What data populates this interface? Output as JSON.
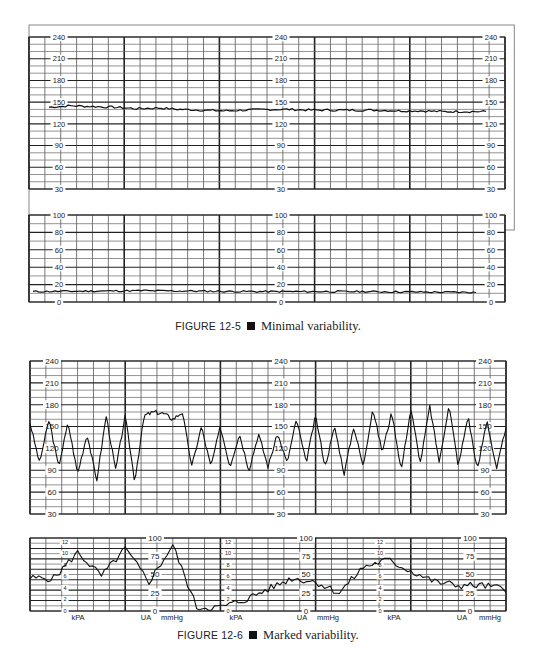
{
  "figures": [
    {
      "id": "fig-12-5",
      "caption": {
        "label": "FIGURE 12-5",
        "text": "Minimal variability."
      },
      "fhr_ticks": [
        "240",
        "210",
        "180",
        "150",
        "120",
        "90",
        "60",
        "30"
      ],
      "ua_ticks": [
        "100",
        "80",
        "60",
        "40",
        "20",
        "0"
      ]
    },
    {
      "id": "fig-12-6",
      "caption": {
        "label": "FIGURE 12-6",
        "text": "Marked variability."
      },
      "fhr_ticks": [
        "240",
        "210",
        "180",
        "150",
        "120",
        "90",
        "60",
        "30"
      ],
      "ua_mmhg_ticks": [
        "100",
        "75",
        "50",
        "25",
        "0"
      ],
      "ua_kpa_ticks": [
        "12",
        "10",
        "8",
        "6",
        "4",
        "2",
        "0"
      ],
      "ua_labels": {
        "kpa": "kPA",
        "ua": "UA",
        "mmhg": "mmHg"
      }
    }
  ],
  "chart_data": [
    {
      "type": "line",
      "title": "FIGURE 12-5 Minimal variability.",
      "panels": [
        {
          "name": "Fetal heart rate",
          "ylabel": "bpm",
          "ylim": [
            30,
            240
          ],
          "yticks": [
            30,
            60,
            90,
            120,
            150,
            180,
            210,
            240
          ],
          "x": [
            0,
            0.05,
            0.1,
            0.15,
            0.2,
            0.25,
            0.3,
            0.35,
            0.4,
            0.45,
            0.5,
            0.55,
            0.6,
            0.65,
            0.7,
            0.75,
            0.8,
            0.85,
            0.9,
            0.95,
            1.0
          ],
          "values": [
            143,
            145,
            144,
            143,
            141,
            142,
            140,
            139,
            138,
            139,
            140,
            140,
            139,
            139,
            139,
            139,
            138,
            138,
            137,
            137,
            137
          ],
          "note": "Baseline ~140 bpm with amplitude range <5 bpm"
        },
        {
          "name": "Uterine activity",
          "ylabel": "mmHg",
          "ylim": [
            0,
            100
          ],
          "yticks": [
            0,
            20,
            40,
            60,
            80,
            100
          ],
          "x": [
            0,
            0.25,
            0.5,
            0.75,
            1.0
          ],
          "values": [
            12,
            13,
            12,
            12,
            11
          ]
        }
      ],
      "grid": true
    },
    {
      "type": "line",
      "title": "FIGURE 12-6 Marked variability.",
      "panels": [
        {
          "name": "Fetal heart rate",
          "ylabel": "bpm",
          "ylim": [
            30,
            240
          ],
          "yticks": [
            30,
            60,
            90,
            120,
            150,
            180,
            210,
            240
          ],
          "x": [
            0,
            0.02,
            0.04,
            0.06,
            0.08,
            0.1,
            0.12,
            0.14,
            0.16,
            0.18,
            0.2,
            0.22,
            0.24,
            0.26,
            0.28,
            0.3,
            0.32,
            0.34,
            0.36,
            0.38,
            0.4,
            0.42,
            0.44,
            0.46,
            0.48,
            0.5,
            0.52,
            0.54,
            0.56,
            0.58,
            0.6,
            0.62,
            0.64,
            0.66,
            0.68,
            0.7,
            0.72,
            0.74,
            0.76,
            0.78,
            0.8,
            0.82,
            0.84,
            0.86,
            0.88,
            0.9,
            0.92,
            0.94,
            0.96,
            0.98,
            1.0
          ],
          "values": [
            155,
            100,
            160,
            95,
            155,
            85,
            140,
            75,
            165,
            90,
            165,
            75,
            165,
            170,
            168,
            160,
            170,
            95,
            150,
            95,
            150,
            95,
            140,
            90,
            140,
            95,
            140,
            100,
            160,
            100,
            165,
            95,
            150,
            85,
            150,
            95,
            175,
            115,
            170,
            90,
            175,
            100,
            178,
            100,
            180,
            95,
            165,
            90,
            160,
            90,
            150
          ],
          "note": "Amplitude range >25 bpm"
        },
        {
          "name": "Uterine activity",
          "ylabel": "mmHg",
          "ylim": [
            0,
            100
          ],
          "yticks": [
            0,
            25,
            50,
            75,
            100
          ],
          "secondary_ylabel": "kPa",
          "secondary_yticks": [
            0,
            2,
            4,
            6,
            8,
            10,
            12
          ],
          "x": [
            0,
            0.05,
            0.1,
            0.15,
            0.2,
            0.25,
            0.3,
            0.35,
            0.4,
            0.45,
            0.5,
            0.55,
            0.6,
            0.65,
            0.7,
            0.75,
            0.8,
            0.85,
            0.9,
            0.95,
            1.0
          ],
          "values": [
            45,
            45,
            80,
            48,
            85,
            40,
            90,
            5,
            5,
            15,
            30,
            45,
            40,
            25,
            60,
            70,
            55,
            40,
            35,
            35,
            30
          ]
        }
      ],
      "grid": true
    }
  ]
}
